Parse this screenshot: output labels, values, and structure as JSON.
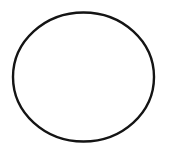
{
  "canvas": {
    "width": 171,
    "height": 156,
    "background": "#ffffff"
  },
  "shapes": [
    {
      "type": "ellipse",
      "cx": 83.5,
      "cy": 77,
      "rx": 70.5,
      "ry": 64.5,
      "stroke": "#141414",
      "stroke_width": 2.4,
      "fill": "none"
    }
  ]
}
